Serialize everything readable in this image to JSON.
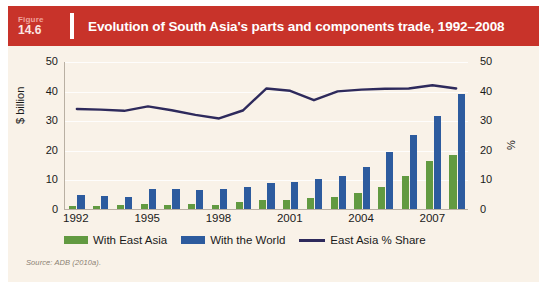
{
  "figure": {
    "label_word": "Figure",
    "number": "14.6",
    "title": "Evolution of South Asia's parts and components trade, 1992–2008"
  },
  "source_note": "Source: ADB (2010a).",
  "colors": {
    "banner": "#c8332a",
    "background": "#f9f2e8",
    "green": "#629a41",
    "blue": "#2d5b9e",
    "line": "#2e2a5c"
  },
  "axes": {
    "left_title": "$ billion",
    "right_title": "%",
    "left_ticks": [
      "0",
      "10",
      "20",
      "30",
      "40",
      "50"
    ],
    "right_ticks": [
      "0",
      "10",
      "20",
      "30",
      "40",
      "50"
    ],
    "x_tick_labels": [
      "1992",
      "1995",
      "1998",
      "2001",
      "2004",
      "2007"
    ]
  },
  "legend": {
    "items": [
      {
        "label": "With East Asia",
        "marker": "green-swatch"
      },
      {
        "label": "With the World",
        "marker": "blue-swatch"
      },
      {
        "label": "East Asia % Share",
        "marker": "line-swatch"
      }
    ]
  },
  "chart_data": {
    "type": "bar",
    "title": "Evolution of South Asia's parts and components trade, 1992–2008",
    "xlabel": "",
    "ylabel": "$ billion",
    "y2label": "%",
    "ylim": [
      0,
      50
    ],
    "y2lim": [
      0,
      50
    ],
    "grid": true,
    "legend_position": "bottom",
    "categories": [
      "1992",
      "1993",
      "1994",
      "1995",
      "1996",
      "1997",
      "1998",
      "1999",
      "2000",
      "2001",
      "2002",
      "2003",
      "2004",
      "2005",
      "2006",
      "2007",
      "2008"
    ],
    "series": [
      {
        "name": "With East Asia",
        "type": "bar",
        "color": "#629a41",
        "axis": "left",
        "unit": "$ billion",
        "values": [
          1.0,
          1.1,
          1.2,
          1.6,
          1.4,
          1.7,
          1.5,
          2.5,
          3.0,
          3.2,
          3.6,
          4.2,
          5.4,
          7.5,
          11.0,
          16.2,
          18.3
        ]
      },
      {
        "name": "With the World",
        "type": "bar",
        "color": "#2d5b9e",
        "axis": "left",
        "unit": "$ billion",
        "values": [
          4.6,
          4.5,
          4.0,
          6.6,
          6.7,
          6.4,
          6.6,
          7.5,
          8.8,
          9.0,
          10.0,
          11.3,
          14.2,
          19.3,
          25.0,
          31.5,
          38.9
        ]
      },
      {
        "name": "East Asia % Share",
        "type": "line",
        "color": "#2e2a5c",
        "axis": "right",
        "unit": "%",
        "values": [
          34.0,
          33.8,
          33.4,
          34.9,
          33.6,
          32.0,
          30.8,
          33.5,
          41.0,
          40.2,
          37.0,
          40.0,
          40.6,
          40.9,
          41.0,
          42.1,
          41.0
        ]
      }
    ]
  }
}
